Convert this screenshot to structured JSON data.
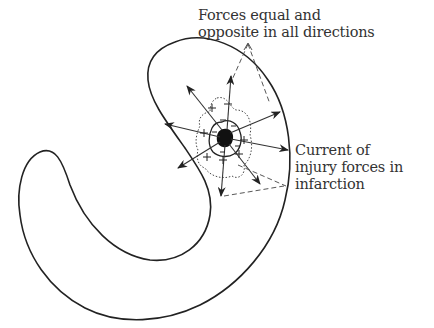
{
  "figure": {
    "type": "diagram",
    "labels": {
      "forces": {
        "line1": "Forces equal and",
        "line2": "opposite in all directions"
      },
      "injury": {
        "line1": "Current of",
        "line2": "injury forces in",
        "line3": "infarction"
      }
    },
    "symbols": {
      "plus": "+",
      "minus": "−"
    },
    "colors": {
      "ink": "#222222",
      "background": "#ffffff",
      "text": "#333333"
    }
  }
}
